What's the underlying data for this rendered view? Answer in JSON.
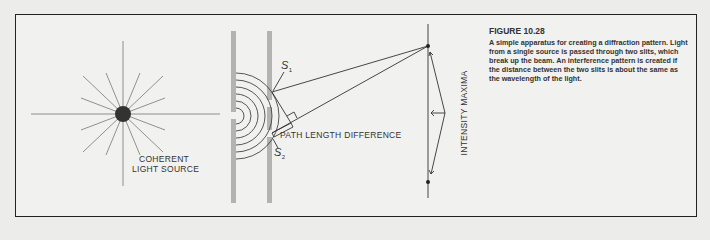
{
  "figure": {
    "title": "FIGURE 10.28",
    "caption": "A simple apparatus for creating a diffraction pattern. Light from a single source is passed through two slits, which break up the beam.  An interference pattern is created if the distance between the two slits is about the same as the wavelength of the light."
  },
  "labels": {
    "source_line1": "COHERENT",
    "source_line2": "LIGHT SOURCE",
    "slit1_symbol": "S",
    "slit1_sub": "1",
    "slit2_symbol": "S",
    "slit2_sub": "2",
    "path_length": "PATH LENGTH DIFFERENCE",
    "intensity": "INTENSITY MAXIMA"
  },
  "colors": {
    "background": "#ececea",
    "panel": "#f1f1ef",
    "line": "#555555",
    "barrier": "#b3b3b1",
    "ink": "#333333"
  }
}
